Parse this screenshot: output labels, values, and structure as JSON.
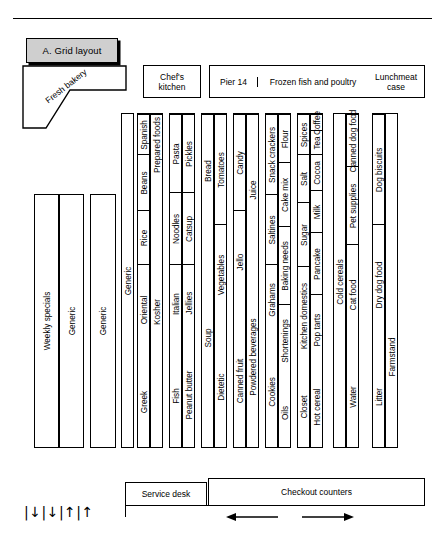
{
  "title": {
    "plaque": "A. Grid layout"
  },
  "departments": {
    "bakery": "Fresh bakery",
    "chefs_kitchen": "Chef's\nkitchen",
    "chefs_kitchen_line1": "Chef's",
    "chefs_kitchen_line2": "kitchen",
    "pier": "Pier 14",
    "frozen": "Frozen fish and poultry",
    "lunchmeat_line1": "Lunchmeat",
    "lunchmeat_line2": "case"
  },
  "left_block": {
    "columns": [
      {
        "label": "Weekly specials"
      },
      {
        "label": "Generic"
      }
    ],
    "standalone": {
      "label": "Generic"
    },
    "spanning": {
      "label": "Generic"
    }
  },
  "gondolas": [
    {
      "name": "gondola-1",
      "left": 137,
      "width": 26,
      "columns": [
        {
          "width": 13,
          "segments": [
            {
              "label": "Greek",
              "top": 240,
              "height": 95
            },
            {
              "label": "Oriental",
              "top": 150,
              "height": 90
            },
            {
              "label": "Rice",
              "top": 96,
              "height": 54
            },
            {
              "label": "Beans",
              "top": 40,
              "height": 56
            },
            {
              "label": "Spanish",
              "top": 0,
              "height": 40
            }
          ]
        },
        {
          "width": 13,
          "segments": [
            {
              "label": "Kosher",
              "top": 60,
              "height": 275
            },
            {
              "label": "Prepared foods",
              "top": 0,
              "height": 60
            }
          ]
        }
      ]
    },
    {
      "name": "gondola-2",
      "left": 169,
      "width": 26,
      "columns": [
        {
          "width": 13,
          "segments": [
            {
              "label": "Fish",
              "top": 228,
              "height": 107
            },
            {
              "label": "Italian",
              "top": 150,
              "height": 78
            },
            {
              "label": "Noodles",
              "top": 78,
              "height": 72
            },
            {
              "label": "Pasta",
              "top": 0,
              "height": 78
            }
          ]
        },
        {
          "width": 13,
          "segments": [
            {
              "label": "Peanut butter",
              "top": 226,
              "height": 109
            },
            {
              "label": "Jellies",
              "top": 150,
              "height": 76
            },
            {
              "label": "Catsup",
              "top": 78,
              "height": 72
            },
            {
              "label": "Pickles",
              "top": 0,
              "height": 78
            }
          ]
        }
      ]
    },
    {
      "name": "gondola-3",
      "left": 201,
      "width": 26,
      "columns": [
        {
          "width": 13,
          "segments": [
            {
              "label": "Soup",
              "top": 112,
              "height": 223
            },
            {
              "label": "Bread",
              "top": 0,
              "height": 112
            }
          ]
        },
        {
          "width": 13,
          "segments": [
            {
              "label": "Dietetic",
              "top": 210,
              "height": 125
            },
            {
              "label": "Vegetables",
              "top": 110,
              "height": 100
            },
            {
              "label": "Tomatoes",
              "top": 0,
              "height": 110
            }
          ]
        }
      ]
    },
    {
      "name": "gondola-4",
      "left": 233,
      "width": 26,
      "columns": [
        {
          "width": 13,
          "segments": [
            {
              "label": "Canned fruit",
              "top": 198,
              "height": 137
            },
            {
              "label": "Jello",
              "top": 96,
              "height": 102
            },
            {
              "label": "Candy",
              "top": 0,
              "height": 96
            }
          ]
        },
        {
          "width": 13,
          "segments": [
            {
              "label": "Powdered beverages",
              "top": 150,
              "height": 185
            },
            {
              "label": "Juice",
              "top": 0,
              "height": 150
            }
          ]
        }
      ]
    },
    {
      "name": "gondola-5",
      "left": 265,
      "width": 26,
      "columns": [
        {
          "width": 13,
          "segments": [
            {
              "label": "Cookies",
              "top": 220,
              "height": 115
            },
            {
              "label": "Grahams",
              "top": 150,
              "height": 70
            },
            {
              "label": "Saltines",
              "top": 80,
              "height": 70
            },
            {
              "label": "Snack crackers",
              "top": 0,
              "height": 80
            }
          ]
        },
        {
          "width": 13,
          "segments": [
            {
              "label": "Oils",
              "top": 262,
              "height": 73
            },
            {
              "label": "Shortenings",
              "top": 190,
              "height": 72
            },
            {
              "label": "Baking needs",
              "top": 112,
              "height": 78
            },
            {
              "label": "Cake mix",
              "top": 48,
              "height": 64
            },
            {
              "label": "Flour",
              "top": 0,
              "height": 48
            }
          ]
        }
      ]
    },
    {
      "name": "gondola-6",
      "left": 297,
      "width": 26,
      "columns": [
        {
          "width": 13,
          "segments": [
            {
              "label": "Closet",
              "top": 250,
              "height": 85
            },
            {
              "label": "Kitchen domestics",
              "top": 152,
              "height": 98
            },
            {
              "label": "Sugar",
              "top": 88,
              "height": 64
            },
            {
              "label": "Salt",
              "top": 40,
              "height": 48
            },
            {
              "label": "Spices",
              "top": 0,
              "height": 40
            }
          ]
        },
        {
          "width": 13,
          "segments": [
            {
              "label": "Hot cereal",
              "top": 250,
              "height": 85
            },
            {
              "label": "Pop tarts",
              "top": 180,
              "height": 70
            },
            {
              "label": "Pancake",
              "top": 118,
              "height": 62
            },
            {
              "label": "Milk",
              "top": 76,
              "height": 42
            },
            {
              "label": "Cocoa",
              "top": 40,
              "height": 36
            },
            {
              "label": "Tea",
              "top": 16,
              "height": 24
            },
            {
              "label": "Coffee",
              "top": 0,
              "height": 16
            }
          ]
        }
      ]
    },
    {
      "name": "gondola-7",
      "left": 333,
      "width": 26,
      "columns": [
        {
          "width": 13,
          "segments": [
            {
              "label": "Cold cereals",
              "top": 0,
              "height": 335
            }
          ]
        },
        {
          "width": 13,
          "segments": [
            {
              "label": "Water",
              "top": 230,
              "height": 105
            },
            {
              "label": "Cat food",
              "top": 130,
              "height": 100
            },
            {
              "label": "Pet supplies",
              "top": 52,
              "height": 78
            },
            {
              "label": "Canned dog food",
              "top": 0,
              "height": 52
            }
          ]
        }
      ]
    },
    {
      "name": "gondola-8",
      "left": 372,
      "width": 26,
      "columns": [
        {
          "width": 13,
          "segments": [
            {
              "label": "Litter",
              "top": 230,
              "height": 105
            },
            {
              "label": "Dry dog food",
              "top": 110,
              "height": 120
            },
            {
              "label": "Dog biscuits",
              "top": 0,
              "height": 110
            }
          ]
        },
        {
          "width": 13,
          "segments": [
            {
              "label": "Farmstand",
              "top": 150,
              "height": 185
            }
          ]
        }
      ]
    }
  ],
  "bottom": {
    "service_desk": "Service desk",
    "checkout": "Checkout counters",
    "traffic_arrows": "|↓|↓|↑|↑",
    "flow_left": "left-arrow",
    "flow_right": "right-arrow"
  }
}
